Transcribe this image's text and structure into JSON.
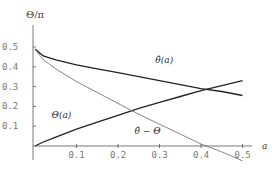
{
  "chart_data": {
    "type": "line",
    "title": "",
    "ylabel": "Θ/π",
    "xlabel": "a",
    "xlim": [
      0,
      0.5
    ],
    "ylim": [
      0,
      0.5
    ],
    "grid": false,
    "legend": "none (inline curve labels)",
    "x_ticks": [
      "0.1",
      "0.2",
      "0.3",
      "0.4",
      "0.5"
    ],
    "y_ticks": [
      "0.1",
      "0.2",
      "0.3",
      "0.4",
      "0.5"
    ],
    "series": [
      {
        "name": "θ̂(a)",
        "style": "thick",
        "x": [
          0,
          0.02,
          0.05,
          0.1,
          0.15,
          0.2,
          0.25,
          0.3,
          0.35,
          0.4,
          0.45,
          0.5
        ],
        "y": [
          0.49,
          0.455,
          0.435,
          0.41,
          0.39,
          0.37,
          0.35,
          0.33,
          0.31,
          0.29,
          0.275,
          0.255
        ]
      },
      {
        "name": "Θ(a)",
        "style": "thick",
        "x": [
          0,
          0.02,
          0.05,
          0.1,
          0.15,
          0.2,
          0.25,
          0.3,
          0.35,
          0.4,
          0.45,
          0.5
        ],
        "y": [
          0,
          0.02,
          0.045,
          0.085,
          0.12,
          0.155,
          0.19,
          0.22,
          0.25,
          0.28,
          0.305,
          0.33
        ]
      },
      {
        "name": "θ̂ − Θ",
        "style": "thin",
        "x": [
          0,
          0.02,
          0.05,
          0.1,
          0.15,
          0.2,
          0.25,
          0.3,
          0.35,
          0.4,
          0.45,
          0.5
        ],
        "y": [
          0.49,
          0.435,
          0.39,
          0.325,
          0.27,
          0.215,
          0.16,
          0.11,
          0.06,
          0.01,
          -0.03,
          -0.075
        ]
      }
    ],
    "annotations": [
      {
        "text": "θ̂(a)",
        "x": 0.29,
        "y": 0.42
      },
      {
        "text": "Θ(a)",
        "x": 0.04,
        "y": 0.14
      },
      {
        "text": "θ̂ − Θ",
        "x": 0.24,
        "y": 0.06
      }
    ]
  }
}
